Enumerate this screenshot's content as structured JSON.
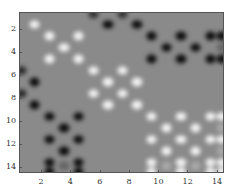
{
  "chart_data": {
    "type": "heatmap",
    "title": "",
    "xlabel": "",
    "ylabel": "",
    "xlim": [
      0.5,
      14.5
    ],
    "ylim": [
      14.5,
      0.5
    ],
    "y_reversed": true,
    "grid": false,
    "colormap": "gray",
    "background_value": 0,
    "xticks": [
      2,
      4,
      6,
      8,
      10,
      12,
      14
    ],
    "yticks": [
      2,
      4,
      6,
      8,
      10,
      12,
      14
    ],
    "xtick_labels": [
      "2",
      "4",
      "6",
      "8",
      "10",
      "12",
      "14"
    ],
    "ytick_labels": [
      "2",
      "4",
      "6",
      "8",
      "10",
      "12",
      "14"
    ],
    "points": [
      {
        "x": 1.5,
        "y": 1.5,
        "v": 1
      },
      {
        "x": 2.5,
        "y": 2.5,
        "v": 1
      },
      {
        "x": 4.5,
        "y": 2.5,
        "v": 1
      },
      {
        "x": 3.5,
        "y": 3.5,
        "v": 1
      },
      {
        "x": 2.5,
        "y": 4.5,
        "v": 1
      },
      {
        "x": 4.5,
        "y": 4.5,
        "v": 1
      },
      {
        "x": 5.5,
        "y": 5.5,
        "v": 1
      },
      {
        "x": 7.5,
        "y": 5.5,
        "v": 1
      },
      {
        "x": 6.5,
        "y": 6.5,
        "v": 1
      },
      {
        "x": 8.5,
        "y": 6.5,
        "v": 1
      },
      {
        "x": 5.5,
        "y": 7.5,
        "v": 1
      },
      {
        "x": 7.5,
        "y": 7.5,
        "v": 1
      },
      {
        "x": 6.5,
        "y": 8.5,
        "v": 1
      },
      {
        "x": 8.5,
        "y": 8.5,
        "v": 1
      },
      {
        "x": 9.5,
        "y": 9.5,
        "v": 1
      },
      {
        "x": 11.5,
        "y": 9.5,
        "v": 1
      },
      {
        "x": 13.5,
        "y": 9.5,
        "v": 1
      },
      {
        "x": 14.3,
        "y": 9.5,
        "v": 1
      },
      {
        "x": 10.5,
        "y": 10.5,
        "v": 1
      },
      {
        "x": 12.5,
        "y": 10.5,
        "v": 1
      },
      {
        "x": 9.5,
        "y": 11.5,
        "v": 1
      },
      {
        "x": 11.5,
        "y": 11.5,
        "v": 1
      },
      {
        "x": 13.5,
        "y": 11.5,
        "v": 1
      },
      {
        "x": 14.3,
        "y": 11.5,
        "v": 1
      },
      {
        "x": 10.5,
        "y": 12.5,
        "v": 1
      },
      {
        "x": 12.5,
        "y": 12.5,
        "v": 1
      },
      {
        "x": 9.5,
        "y": 13.5,
        "v": 1
      },
      {
        "x": 9.5,
        "y": 14.3,
        "v": 1
      },
      {
        "x": 11.5,
        "y": 13.5,
        "v": 1
      },
      {
        "x": 11.5,
        "y": 14.3,
        "v": 1
      },
      {
        "x": 13.5,
        "y": 13.5,
        "v": 1
      },
      {
        "x": 13.5,
        "y": 14.3,
        "v": 1
      },
      {
        "x": 14.3,
        "y": 13.5,
        "v": 1
      },
      {
        "x": 14.3,
        "y": 14.3,
        "v": 1
      },
      {
        "x": 10.5,
        "y": 13.8,
        "v": 0.3
      },
      {
        "x": 12.5,
        "y": 13.8,
        "v": 0.3
      },
      {
        "x": 14.3,
        "y": 10.5,
        "v": 0.3
      },
      {
        "x": 14.3,
        "y": 12.5,
        "v": 0.3
      },
      {
        "x": 5.5,
        "y": 0.6,
        "v": -0.7
      },
      {
        "x": 7.5,
        "y": 0.6,
        "v": -0.7
      },
      {
        "x": 6.5,
        "y": 1.5,
        "v": -1
      },
      {
        "x": 8.5,
        "y": 1.5,
        "v": -1
      },
      {
        "x": 9.5,
        "y": 2.5,
        "v": -1
      },
      {
        "x": 11.5,
        "y": 2.5,
        "v": -1
      },
      {
        "x": 13.5,
        "y": 2.5,
        "v": -1
      },
      {
        "x": 14.3,
        "y": 2.5,
        "v": -1
      },
      {
        "x": 10.5,
        "y": 3.5,
        "v": -1
      },
      {
        "x": 12.5,
        "y": 3.5,
        "v": -1
      },
      {
        "x": 9.5,
        "y": 4.5,
        "v": -1
      },
      {
        "x": 11.5,
        "y": 4.5,
        "v": -1
      },
      {
        "x": 13.5,
        "y": 4.5,
        "v": -1
      },
      {
        "x": 14.3,
        "y": 4.5,
        "v": -1
      },
      {
        "x": 14.3,
        "y": 3.5,
        "v": -0.3
      },
      {
        "x": 0.6,
        "y": 5.5,
        "v": -0.8
      },
      {
        "x": 1.5,
        "y": 6.5,
        "v": -1
      },
      {
        "x": 0.6,
        "y": 7.5,
        "v": -0.8
      },
      {
        "x": 1.5,
        "y": 8.5,
        "v": -1
      },
      {
        "x": 2.5,
        "y": 9.5,
        "v": -1
      },
      {
        "x": 4.5,
        "y": 9.5,
        "v": -1
      },
      {
        "x": 3.5,
        "y": 10.5,
        "v": -1
      },
      {
        "x": 2.5,
        "y": 11.5,
        "v": -1
      },
      {
        "x": 4.5,
        "y": 11.5,
        "v": -1
      },
      {
        "x": 3.5,
        "y": 12.5,
        "v": -1
      },
      {
        "x": 2.5,
        "y": 13.5,
        "v": -1
      },
      {
        "x": 2.5,
        "y": 14.3,
        "v": -1
      },
      {
        "x": 4.5,
        "y": 13.5,
        "v": -1
      },
      {
        "x": 4.5,
        "y": 14.3,
        "v": -1
      },
      {
        "x": 3.5,
        "y": 13.8,
        "v": -0.3
      }
    ]
  }
}
